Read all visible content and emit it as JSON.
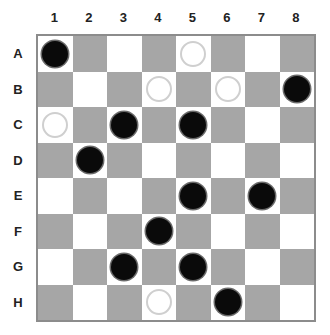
{
  "board": {
    "columns": [
      "1",
      "2",
      "3",
      "4",
      "5",
      "6",
      "7",
      "8"
    ],
    "rows": [
      "A",
      "B",
      "C",
      "D",
      "E",
      "F",
      "G",
      "H"
    ],
    "colors": {
      "light": "#ffffff",
      "dark": "#a6a6a6",
      "black_piece": "#0a0a0a",
      "white_piece": "#ffffff"
    },
    "pieces": [
      {
        "row": "A",
        "col": 1,
        "color": "black"
      },
      {
        "row": "A",
        "col": 5,
        "color": "white"
      },
      {
        "row": "B",
        "col": 4,
        "color": "white"
      },
      {
        "row": "B",
        "col": 6,
        "color": "white"
      },
      {
        "row": "B",
        "col": 8,
        "color": "black"
      },
      {
        "row": "C",
        "col": 1,
        "color": "white"
      },
      {
        "row": "C",
        "col": 3,
        "color": "black"
      },
      {
        "row": "C",
        "col": 5,
        "color": "black"
      },
      {
        "row": "D",
        "col": 2,
        "color": "black"
      },
      {
        "row": "E",
        "col": 5,
        "color": "black"
      },
      {
        "row": "E",
        "col": 7,
        "color": "black"
      },
      {
        "row": "F",
        "col": 4,
        "color": "black"
      },
      {
        "row": "G",
        "col": 3,
        "color": "black"
      },
      {
        "row": "G",
        "col": 5,
        "color": "black"
      },
      {
        "row": "H",
        "col": 4,
        "color": "white"
      },
      {
        "row": "H",
        "col": 6,
        "color": "black"
      }
    ]
  }
}
